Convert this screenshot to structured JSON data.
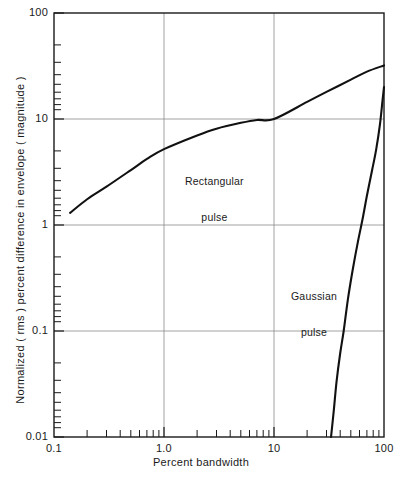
{
  "chart_data": {
    "type": "line",
    "title": "",
    "xlabel": "Percent bandwidth",
    "ylabel": "Normalized ( rms ) percent difference in envelope ( magnitude )",
    "xscale": "log",
    "yscale": "log",
    "xlim": [
      0.1,
      100
    ],
    "ylim": [
      0.01,
      100
    ],
    "grid": true,
    "grid_style": "major decades only, thin gray",
    "xticks": [
      0.1,
      1.0,
      10,
      100
    ],
    "xtick_labels": [
      "0.1",
      "1.0",
      "10",
      "100"
    ],
    "yticks": [
      0.01,
      0.1,
      1,
      10,
      100
    ],
    "ytick_labels": [
      "0.01",
      "0.1",
      "1",
      "10",
      "100"
    ],
    "minor_ticks": "log decade subdivisions (2,3,4,5,6,7,8,9) on both axes, drawn inward",
    "legend_position": "inline annotations on curves",
    "series": [
      {
        "name": "Rectangular pulse",
        "label": "Rectangular\npulse",
        "color": "#111111",
        "points": [
          {
            "x": 0.14,
            "y": 1.3
          },
          {
            "x": 0.2,
            "y": 1.75
          },
          {
            "x": 0.3,
            "y": 2.3
          },
          {
            "x": 0.5,
            "y": 3.3
          },
          {
            "x": 0.7,
            "y": 4.2
          },
          {
            "x": 1.0,
            "y": 5.2
          },
          {
            "x": 2.0,
            "y": 7.0
          },
          {
            "x": 3.0,
            "y": 8.1
          },
          {
            "x": 5.0,
            "y": 9.2
          },
          {
            "x": 7.0,
            "y": 9.8
          },
          {
            "x": 10.0,
            "y": 10.0
          },
          {
            "x": 20.0,
            "y": 14.5
          },
          {
            "x": 30.0,
            "y": 18.0
          },
          {
            "x": 50.0,
            "y": 23.5
          },
          {
            "x": 70.0,
            "y": 28.0
          },
          {
            "x": 100.0,
            "y": 32.0
          }
        ]
      },
      {
        "name": "Gaussian pulse",
        "label": "Gaussian\npulse",
        "color": "#111111",
        "points": [
          {
            "x": 33.0,
            "y": 0.01
          },
          {
            "x": 35.0,
            "y": 0.018
          },
          {
            "x": 37.0,
            "y": 0.033
          },
          {
            "x": 40.0,
            "y": 0.062
          },
          {
            "x": 43.0,
            "y": 0.1
          },
          {
            "x": 47.0,
            "y": 0.2
          },
          {
            "x": 52.0,
            "y": 0.38
          },
          {
            "x": 58.0,
            "y": 0.7
          },
          {
            "x": 64.0,
            "y": 1.15
          },
          {
            "x": 70.0,
            "y": 1.9
          },
          {
            "x": 78.0,
            "y": 3.3
          },
          {
            "x": 85.0,
            "y": 5.2
          },
          {
            "x": 92.0,
            "y": 9.0
          },
          {
            "x": 97.0,
            "y": 15.0
          },
          {
            "x": 100.0,
            "y": 20.0
          }
        ]
      }
    ]
  },
  "axes": {
    "x_tick_labels": [
      "0.1",
      "1.0",
      "10",
      "100"
    ],
    "y_tick_labels": [
      "100",
      "10",
      "1",
      "0.1",
      "0.01"
    ],
    "x_axis_title": "Percent bandwidth",
    "y_axis_title": "Normalized ( rms ) percent difference in envelope ( magnitude )"
  },
  "annotations": {
    "rectangular": {
      "line1": "Rectangular",
      "line2": "pulse"
    },
    "gaussian": {
      "line1": "Gaussian",
      "line2": "pulse"
    }
  },
  "colors": {
    "curve": "#111111",
    "frame": "#1a1a1a",
    "grid": "#8c8c8c",
    "background": "#ffffff"
  }
}
